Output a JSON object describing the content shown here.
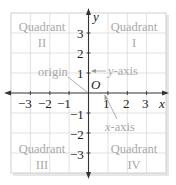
{
  "diagram": {
    "colors": {
      "grid": "#d4d4d4",
      "frame": "#cfcfcf",
      "shadow": "#e6e6e6",
      "axis": "#333333",
      "label_gray": "#a8a8a8",
      "label_dark": "#222222",
      "pointer": "#9a9a9a"
    },
    "axes": {
      "x_label": "x",
      "y_label": "y",
      "origin_label": "O",
      "x_ticks": [
        "−3",
        "−2",
        "−1",
        "1",
        "2",
        "3"
      ],
      "y_ticks": [
        "3",
        "2",
        "1",
        "−1",
        "−2",
        "−3"
      ]
    },
    "quadrants": [
      {
        "id": "I",
        "word": "Quadrant",
        "numeral": "I"
      },
      {
        "id": "II",
        "word": "Quadrant",
        "numeral": "II"
      },
      {
        "id": "III",
        "word": "Quadrant",
        "numeral": "III"
      },
      {
        "id": "IV",
        "word": "Quadrant",
        "numeral": "IV"
      }
    ],
    "callouts": {
      "origin": "origin",
      "y_axis_prefix": "y",
      "y_axis_suffix": "-axis",
      "x_axis_prefix": "x",
      "x_axis_suffix": "-axis"
    }
  }
}
